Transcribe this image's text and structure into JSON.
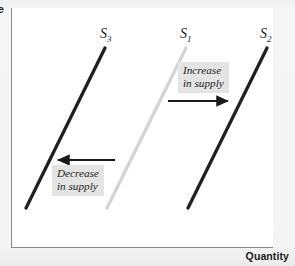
{
  "figure": {
    "background_color": "#f2f2f2",
    "panel_color": "#ffffff",
    "axis_color": "#8a8a8a"
  },
  "axes": {
    "y_title": "Price",
    "y_title_visible_fragment": "e",
    "x_title": "Quantity"
  },
  "curves": [
    {
      "id": "S3",
      "label": "S",
      "subscript": "3",
      "color": "#231f20",
      "width": 3.2,
      "x1": 26,
      "y1": 208,
      "x2": 105,
      "y2": 48
    },
    {
      "id": "S1",
      "label": "S",
      "subscript": "1",
      "color": "#d4d4d4",
      "width": 3.2,
      "x1": 107,
      "y1": 208,
      "x2": 186,
      "y2": 48
    },
    {
      "id": "S2",
      "label": "S",
      "subscript": "2",
      "color": "#231f20",
      "width": 3.2,
      "x1": 188,
      "y1": 208,
      "x2": 267,
      "y2": 48
    }
  ],
  "annotations": [
    {
      "id": "increase",
      "line1": "Increase",
      "line2": "in supply",
      "box_color": "#e4e4e4",
      "arrow_direction": "right",
      "arrow_x1": 168,
      "arrow_x2": 231,
      "arrow_y": 101
    },
    {
      "id": "decrease",
      "line1": "Decrease",
      "line2": "in supply",
      "box_color": "#e4e4e4",
      "arrow_direction": "left",
      "arrow_x1": 115,
      "arrow_x2": 55,
      "arrow_y": 160
    }
  ],
  "chart_data": {
    "type": "line",
    "xlabel": "Quantity",
    "ylabel": "Price",
    "grid": false,
    "legend": "none",
    "series": [
      {
        "name": "S3",
        "description": "Supply curve shifted left (decrease in supply)",
        "color": "#231f20",
        "points": [
          [
            26,
            208
          ],
          [
            105,
            48
          ]
        ]
      },
      {
        "name": "S1",
        "description": "Original supply curve",
        "color": "#d4d4d4",
        "points": [
          [
            107,
            208
          ],
          [
            186,
            48
          ]
        ]
      },
      {
        "name": "S2",
        "description": "Supply curve shifted right (increase in supply)",
        "color": "#231f20",
        "points": [
          [
            188,
            208
          ],
          [
            267,
            48
          ]
        ]
      }
    ],
    "annotations": [
      {
        "text": "Increase in supply",
        "direction": "right",
        "from": "S1",
        "to": "S2"
      },
      {
        "text": "Decrease in supply",
        "direction": "left",
        "from": "S1",
        "to": "S3"
      }
    ]
  }
}
